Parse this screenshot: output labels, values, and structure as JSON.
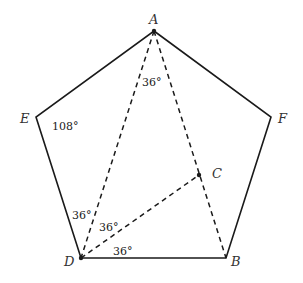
{
  "diagram": {
    "type": "geometry",
    "shape": "pentagon",
    "points": {
      "A": {
        "label": "A",
        "x": 154,
        "y": 31
      },
      "F": {
        "label": "F",
        "x": 271,
        "y": 117
      },
      "B": {
        "label": "B",
        "x": 226,
        "y": 258
      },
      "D": {
        "label": "D",
        "x": 81,
        "y": 258
      },
      "E": {
        "label": "E",
        "x": 36,
        "y": 117
      },
      "C": {
        "label": "C",
        "x": 199,
        "y": 175
      }
    },
    "solid_edges": [
      "A-F",
      "F-B",
      "B-D",
      "D-E",
      "E-A"
    ],
    "dashed_segments": [
      "A-D",
      "A-B",
      "D-C"
    ],
    "angles": {
      "angle_A": "36°",
      "angle_E": "108°",
      "angle_D_upper": "36°",
      "angle_D_middle": "36°",
      "angle_D_lower": "36°"
    },
    "colors": {
      "stroke": "#1a1a1a",
      "background": "#ffffff"
    }
  }
}
